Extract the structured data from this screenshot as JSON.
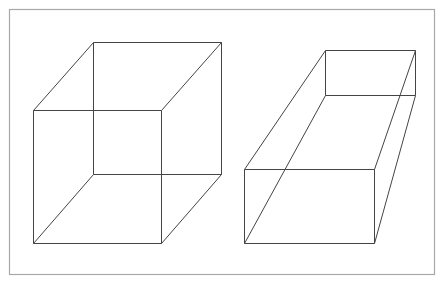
{
  "colors": {
    "background": "#ffffff",
    "frame": "#a8a8a8",
    "line": "#444444"
  },
  "frame": {
    "x": 9,
    "y": 9,
    "width": 425,
    "height": 265
  },
  "shapes": [
    {
      "name": "left-cube",
      "front": [
        [
          33,
          110
        ],
        [
          161,
          110
        ],
        [
          161,
          243
        ],
        [
          33,
          243
        ]
      ],
      "back": [
        [
          93,
          42
        ],
        [
          221,
          42
        ],
        [
          221,
          174
        ],
        [
          93,
          174
        ]
      ]
    },
    {
      "name": "right-box",
      "front": [
        [
          244,
          169
        ],
        [
          374,
          169
        ],
        [
          374,
          243
        ],
        [
          244,
          243
        ]
      ],
      "back": [
        [
          325,
          50
        ],
        [
          415,
          50
        ],
        [
          415,
          95
        ],
        [
          325,
          95
        ]
      ]
    }
  ]
}
